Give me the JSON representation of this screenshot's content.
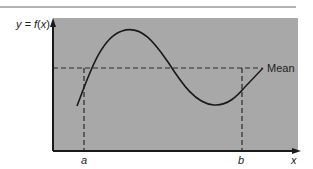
{
  "diagram": {
    "y_axis_label": {
      "prefix": "y = ",
      "func": "f",
      "paren_open": "(",
      "var": "x",
      "paren_close": ")"
    },
    "x_axis_label": "x",
    "point_a_label": "a",
    "point_b_label": "b",
    "mean_label": "Mean",
    "colors": {
      "plot_background": "#a6a6a6",
      "curve": "#1a1a1a",
      "axis": "#1a1a1a",
      "dashed": "#2a2a2a",
      "top_rule": "#555555"
    }
  }
}
